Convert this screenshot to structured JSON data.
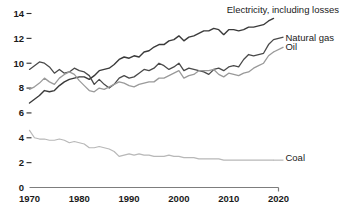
{
  "chart_data": {
    "type": "line",
    "title": "",
    "subtitle": "",
    "xlabel": "",
    "ylabel": "",
    "xlim": [
      1970,
      2020
    ],
    "ylim": [
      0,
      14.6
    ],
    "grid": false,
    "legend_position": "right-inline-labels",
    "y_ticks": [
      0,
      2,
      4,
      6,
      8,
      10,
      12,
      14
    ],
    "y_tick_labels": [
      "0",
      "2",
      "4",
      "6",
      "8",
      "10",
      "12",
      "14"
    ],
    "x_ticks": [
      1970,
      1980,
      1990,
      2000,
      2010,
      2020
    ],
    "x_tick_labels": [
      "1970",
      "1980",
      "1990",
      "2000",
      "2010",
      "2020"
    ],
    "x": [
      1970,
      1971,
      1972,
      1973,
      1974,
      1975,
      1976,
      1977,
      1978,
      1979,
      1980,
      1981,
      1982,
      1983,
      1984,
      1985,
      1986,
      1987,
      1988,
      1989,
      1990,
      1991,
      1992,
      1993,
      1994,
      1995,
      1996,
      1997,
      1998,
      1999,
      2000,
      2001,
      2002,
      2003,
      2004,
      2005,
      2006,
      2007,
      2008,
      2009,
      2010,
      2011,
      2012,
      2013,
      2014,
      2015,
      2016,
      2017,
      2018,
      2019
    ],
    "series": [
      {
        "name": "Electricity, including losses",
        "label": "Electricity, including losses",
        "color": "#3a3a3a",
        "width": 1.4,
        "label_x": 2002,
        "label_y": 14.3,
        "values": [
          6.8,
          7.1,
          7.4,
          7.8,
          7.7,
          7.8,
          8.2,
          8.5,
          8.7,
          8.8,
          8.9,
          8.9,
          8.7,
          9.0,
          9.4,
          9.5,
          9.6,
          9.9,
          10.3,
          10.5,
          10.4,
          10.6,
          10.5,
          10.9,
          11.0,
          11.3,
          11.5,
          11.5,
          11.8,
          11.9,
          12.2,
          11.8,
          12.1,
          12.2,
          12.4,
          12.6,
          12.6,
          12.8,
          12.7,
          12.3,
          12.7,
          12.7,
          12.6,
          12.7,
          12.9,
          12.9,
          13.0,
          13.1,
          13.4,
          13.6
        ]
      },
      {
        "name": "Natural gas",
        "label": "Natural gas",
        "color": "#4a4a4a",
        "width": 1.3,
        "label_x": 2021,
        "label_y": 12.1,
        "values": [
          9.5,
          9.8,
          10.1,
          10.0,
          9.7,
          9.2,
          9.5,
          9.2,
          9.3,
          9.6,
          9.4,
          9.3,
          9.0,
          8.3,
          8.7,
          8.3,
          8.0,
          8.3,
          8.8,
          9.0,
          8.8,
          8.9,
          9.2,
          9.5,
          9.4,
          9.6,
          10.0,
          9.8,
          9.5,
          9.7,
          10.0,
          9.4,
          9.6,
          9.5,
          9.4,
          9.3,
          9.1,
          9.5,
          9.6,
          9.4,
          9.7,
          9.8,
          9.7,
          10.3,
          10.7,
          10.6,
          10.7,
          10.8,
          11.5,
          11.9
        ]
      },
      {
        "name": "Oil",
        "label": "Oil",
        "color": "#9a9a9a",
        "width": 1.3,
        "label_x": 2021,
        "label_y": 11.3,
        "values": [
          7.9,
          8.1,
          8.4,
          8.8,
          8.5,
          8.3,
          8.8,
          9.1,
          9.3,
          9.1,
          8.6,
          8.2,
          7.8,
          7.7,
          8.0,
          7.9,
          8.1,
          8.3,
          8.5,
          8.4,
          8.2,
          8.1,
          8.3,
          8.4,
          8.5,
          8.5,
          8.8,
          8.8,
          9.0,
          9.2,
          9.4,
          8.8,
          9.0,
          9.1,
          9.4,
          9.4,
          9.4,
          9.5,
          9.1,
          8.9,
          9.2,
          9.1,
          9.0,
          9.2,
          9.3,
          9.6,
          9.8,
          10.0,
          10.6,
          10.9
        ]
      },
      {
        "name": "Coal",
        "label": "Coal",
        "color": "#b8b8b8",
        "width": 1.2,
        "label_x": 2021,
        "label_y": 2.4,
        "values": [
          4.6,
          4.0,
          3.9,
          3.9,
          3.8,
          3.8,
          3.9,
          3.8,
          3.6,
          3.7,
          3.6,
          3.5,
          3.2,
          3.2,
          3.3,
          3.2,
          3.1,
          2.9,
          2.5,
          2.6,
          2.7,
          2.6,
          2.7,
          2.6,
          2.6,
          2.5,
          2.5,
          2.5,
          2.6,
          2.5,
          2.5,
          2.4,
          2.4,
          2.4,
          2.3,
          2.3,
          2.3,
          2.3,
          2.3,
          2.2,
          2.2,
          2.2,
          2.2,
          2.2,
          2.2,
          2.2,
          2.2,
          2.2,
          2.2,
          2.2
        ]
      }
    ]
  }
}
